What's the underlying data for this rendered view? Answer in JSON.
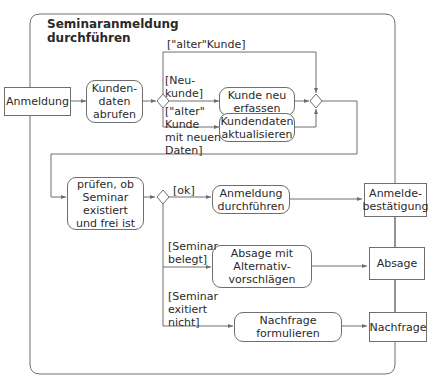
{
  "diagram": {
    "title": "Seminaranmeldung\ndurchführen",
    "colors": {
      "line": "#6e6e6e",
      "text": "#2a2a2a",
      "background": "#ffffff"
    },
    "objects": {
      "anmeldung": "Anmeldung",
      "anmeldebestaetigung": "Anmelde-\nbestätigung",
      "absage": "Absage",
      "nachfrage": "Nachfrage"
    },
    "actions": {
      "kundendaten_abrufen": "Kunden-\ndaten\nabrufen",
      "kunde_neu_erfassen": "Kunde neu\nerfassen",
      "kundendaten_aktualisieren": "Kundendaten\naktualisieren",
      "pruefen_seminar": "prüfen, ob\nSeminar\nexistiert\nund frei ist",
      "anmeldung_durchfuehren": "Anmeldung\ndurchführen",
      "absage_alternativ": "Absage mit\nAlternativ-\nvorschlägen",
      "nachfrage_formulieren": "Nachfrage\nformulieren"
    },
    "guards": {
      "alter_kunde": "[\"alter\"Kunde]",
      "neukunde": "[Neu-\nkunde]",
      "alter_kunde_neue_daten": "[\"alter\"\nKunde\nmit neuen\nDaten]",
      "ok": "[ok]",
      "seminar_belegt": "[Seminar\nbelegt]",
      "seminar_existiert_nicht": "[Seminar\nexitiert\nnicht]"
    }
  }
}
